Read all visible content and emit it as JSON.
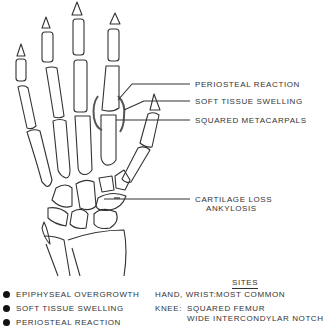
{
  "annotations": {
    "periosteal_reaction": "PERIOSTEAL REACTION",
    "soft_tissue_swelling": "SOFT TISSUE SWELLING",
    "squared_metacarpals": "SQUARED METACARPALS",
    "cartilage_loss": "CARTILAGE LOSS",
    "ankylosis": "ANKYLOSIS"
  },
  "legend": {
    "items": [
      {
        "label": "EPIPHYSEAL OVERGROWTH",
        "icon": "filled-circle-bullet"
      },
      {
        "label": "SOFT TISSUE SWELLING",
        "icon": "filled-circle-bullet"
      },
      {
        "label": "PERIOSTEAL REACTION",
        "icon": "filled-circle-bullet"
      }
    ]
  },
  "sites": {
    "title": "SITES",
    "rows": [
      {
        "key": "HAND, WRIST:",
        "value": "MOST COMMON"
      },
      {
        "key": "KNEE:",
        "value": "SQUARED FEMUR"
      },
      {
        "key": "",
        "value": "WIDE INTERCONDYLAR NOTCH"
      }
    ]
  },
  "colors": {
    "line": "#333333",
    "text": "#333333",
    "background": "#ffffff"
  }
}
